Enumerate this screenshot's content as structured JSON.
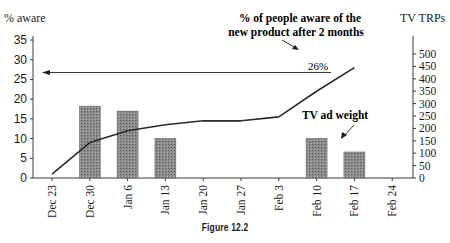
{
  "figure": {
    "caption": "Figure 12.2"
  },
  "chart_data": {
    "type": "bar+line",
    "categories": [
      "Dec 23",
      "Dec 30",
      "Jan 6",
      "Jan 13",
      "Jan 20",
      "Jan 27",
      "Feb 3",
      "Feb 10",
      "Feb 17",
      "Feb 24"
    ],
    "series": [
      {
        "name": "TV ad weight",
        "type": "bar",
        "axis": "right",
        "values": [
          0,
          290,
          270,
          160,
          0,
          0,
          0,
          160,
          105,
          0
        ]
      },
      {
        "name": "% aware",
        "type": "line",
        "axis": "left",
        "values": [
          1,
          9,
          12,
          13.5,
          14.5,
          14.5,
          15.5,
          22,
          28,
          null
        ]
      }
    ],
    "left_axis": {
      "label": "% aware",
      "ylim": [
        0,
        35
      ],
      "ticks": [
        0,
        5,
        10,
        15,
        20,
        25,
        30,
        35
      ]
    },
    "right_axis": {
      "label": "TV TRPs",
      "ylim": [
        0,
        500
      ],
      "ticks": [
        0,
        50,
        100,
        150,
        200,
        250,
        300,
        350,
        400,
        450,
        500
      ]
    },
    "annotations": [
      {
        "text": "% of people aware of the",
        "text2": "new product after 2 months"
      },
      {
        "text": "26%",
        "type": "reference-arrow",
        "value": 26
      },
      {
        "text": "TV ad weight"
      }
    ],
    "grid": false,
    "legend": "none"
  }
}
